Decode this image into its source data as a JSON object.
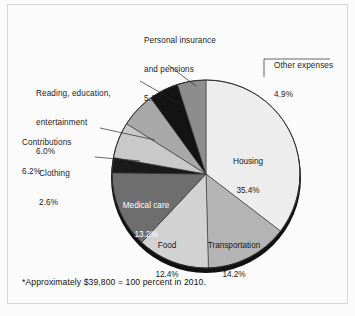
{
  "figure": {
    "background": "#fbfbfb",
    "frame_color": "#d8d8d8",
    "footnote": "*Approximately $39,800 = 100 percent in 2010."
  },
  "chart_data": {
    "type": "pie",
    "title": "",
    "subtitle": "",
    "xlabel": "",
    "ylabel": "",
    "legend": "none",
    "grid": false,
    "total_label": "*Approximately $39,800 = 100 percent in 2010.",
    "start_angle_deg": 0,
    "direction": "clockwise",
    "center": {
      "x": 206,
      "y": 174
    },
    "radius": 94,
    "categories": [
      "Housing",
      "Transportation",
      "Food",
      "Medical care",
      "Clothing",
      "Contributions",
      "Reading, education, entertainment",
      "Personal insurance and pensions",
      "Other expenses"
    ],
    "values": [
      35.4,
      14.2,
      12.4,
      13.2,
      2.6,
      6.2,
      6.0,
      5.1,
      4.9
    ],
    "value_labels": [
      "35.4%",
      "14.2%",
      "12.4%",
      "13.2%",
      "2.6%",
      "6.2%",
      "6.0%",
      "5.1%",
      "4.9%"
    ],
    "colors": [
      "#ededed",
      "#b4b4b4",
      "#d2d2d2",
      "#6e6e6e",
      "#1a1a1a",
      "#c9c9c9",
      "#a8a8a8",
      "#131313",
      "#8d8d8d"
    ],
    "slices": [
      {
        "name": "Housing",
        "value": 35.4,
        "label": "Housing",
        "value_label": "35.4%",
        "color": "#ededed",
        "label_placement": "inside",
        "label_color": "#171717"
      },
      {
        "name": "Transportation",
        "value": 14.2,
        "label": "Transportation",
        "value_label": "14.2%",
        "color": "#b4b4b4",
        "label_placement": "inside",
        "label_color": "#171717"
      },
      {
        "name": "Food",
        "value": 12.4,
        "label": "Food",
        "value_label": "12.4%",
        "color": "#d2d2d2",
        "label_placement": "inside",
        "label_color": "#171717"
      },
      {
        "name": "Medical care",
        "value": 13.2,
        "label": "Medical care",
        "value_label": "13.2%",
        "color": "#6e6e6e",
        "label_placement": "inside",
        "label_color": "#ffffff"
      },
      {
        "name": "Clothing",
        "value": 2.6,
        "label": "Clothing",
        "value_label": "2.6%",
        "color": "#1a1a1a",
        "label_placement": "outside-left",
        "label_color": "#1b1b1b"
      },
      {
        "name": "Contributions",
        "value": 6.2,
        "label": "Contributions",
        "value_label": "6.2%",
        "color": "#c9c9c9",
        "label_placement": "outside-left",
        "label_color": "#1b1b1b"
      },
      {
        "name": "Reading, education, entertainment",
        "value": 6.0,
        "label_line1": "Reading, education,",
        "label_line2": "entertainment",
        "value_label": "6.0%",
        "color": "#a8a8a8",
        "label_placement": "outside-left",
        "label_color": "#1b1b1b"
      },
      {
        "name": "Personal insurance and pensions",
        "value": 5.1,
        "label_line1": "Personal insurance",
        "label_line2": "and pensions",
        "value_label": "5.1%",
        "color": "#131313",
        "label_placement": "outside-top",
        "label_color": "#1b1b1b"
      },
      {
        "name": "Other expenses",
        "value": 4.9,
        "label": "Other expenses",
        "value_label": "4.9%",
        "color": "#8d8d8d",
        "label_placement": "outside-right",
        "label_color": "#1b1b1b"
      }
    ]
  },
  "labels": {
    "personal_insurance": {
      "line1": "Personal insurance",
      "line2": "and pensions",
      "line3": "5.1%"
    },
    "other_expenses": {
      "line1": "Other expenses",
      "line2": "4.9%"
    },
    "reading": {
      "line1": "Reading, education,",
      "line2": "entertainment",
      "line3": "6.0%"
    },
    "contributions": {
      "line1": "Contributions",
      "line2": "6.2%"
    },
    "clothing": {
      "line1": "Clothing",
      "line2": "2.6%"
    },
    "medical_care": {
      "line1": "Medical care",
      "line2": "13.2%"
    },
    "food": {
      "line1": "Food",
      "line2": "12.4%"
    },
    "transportation": {
      "line1": "Transportation",
      "line2": "14.2%"
    },
    "housing": {
      "line1": "Housing",
      "line2": "35.4%"
    }
  }
}
